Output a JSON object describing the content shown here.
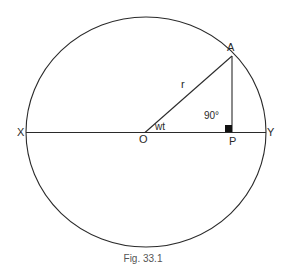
{
  "figure": {
    "caption": "Fig. 33.1",
    "labels": {
      "A": "A",
      "r": "r",
      "right_angle": "90°",
      "X": "X",
      "Y": "Y",
      "O": "O",
      "angle": "wt",
      "P": "P"
    },
    "colors": {
      "stroke": "#2a2a2a",
      "background": "#ffffff"
    }
  }
}
